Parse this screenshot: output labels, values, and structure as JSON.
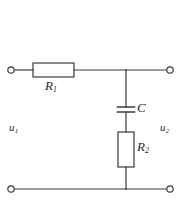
{
  "figure": {
    "name": "rc-voltage-divider-circuit",
    "type": "schematic",
    "background_color": "#ffffff",
    "line_color": "#3a3a3a",
    "label_color": "#2b2b2b"
  },
  "labels": {
    "resistor_1": {
      "symbol": "R",
      "subscript": "1"
    },
    "resistor_2": {
      "symbol": "R",
      "subscript": "2"
    },
    "capacitor": {
      "symbol": "C",
      "subscript": ""
    },
    "input_voltage": {
      "symbol": "u",
      "subscript": "1"
    },
    "output_voltage": {
      "symbol": "u",
      "subscript": "2"
    }
  },
  "components": [
    {
      "name": "resistor-r1",
      "kind": "resistor",
      "orientation": "horizontal",
      "label": "R1"
    },
    {
      "name": "capacitor-c",
      "kind": "capacitor",
      "orientation": "vertical",
      "label": "C"
    },
    {
      "name": "resistor-r2",
      "kind": "resistor",
      "orientation": "vertical",
      "label": "R2"
    }
  ],
  "terminals": [
    {
      "name": "terminal-top-left",
      "position": "top-left"
    },
    {
      "name": "terminal-top-right",
      "position": "top-right"
    },
    {
      "name": "terminal-bottom-left",
      "position": "bottom-left"
    },
    {
      "name": "terminal-bottom-right",
      "position": "bottom-right"
    }
  ]
}
